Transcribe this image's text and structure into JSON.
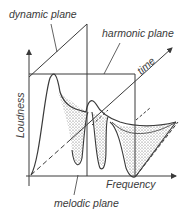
{
  "diagram": {
    "labels": {
      "dynamic_plane": "dynamic plane",
      "harmonic_plane": "harmonic plane",
      "time": "time",
      "loudness": "Loudness",
      "frequency": "Frequency",
      "melodic_plane": "melodic plane"
    },
    "colors": {
      "line": "#3a3a3a",
      "stipple": "#555555",
      "background": "#ffffff"
    }
  }
}
